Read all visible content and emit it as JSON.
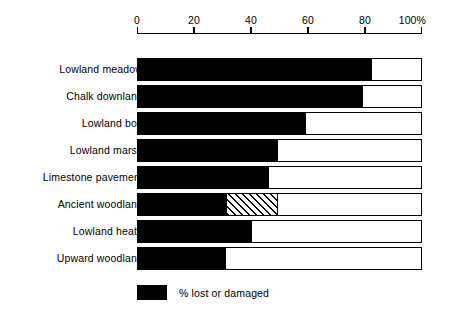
{
  "chart_data": {
    "type": "bar",
    "orientation": "horizontal",
    "title": "",
    "subtitle": "",
    "xlabel": "",
    "ylabel": "",
    "xlim": [
      0,
      100
    ],
    "grid": false,
    "axis_unit_suffix": "%",
    "tick_values": [
      0,
      20,
      40,
      60,
      80,
      100
    ],
    "tick_labels": [
      "0",
      "20",
      "40",
      "60",
      "80",
      "100%"
    ],
    "categories": [
      "Lowland meadow",
      "Chalk downland",
      "Lowland bog",
      "Lowland marsh",
      "Limestone pavement",
      "Ancient woodland",
      "Lowland heath",
      "Upward woodland"
    ],
    "values": [
      82,
      79,
      59,
      49,
      46,
      49,
      40,
      31
    ],
    "bars": [
      {
        "category": "Lowland meadow",
        "solid": 82,
        "hatch_start": null,
        "hatch_end": null,
        "total": 82
      },
      {
        "category": "Chalk downland",
        "solid": 79,
        "hatch_start": null,
        "hatch_end": null,
        "total": 79
      },
      {
        "category": "Lowland bog",
        "solid": 59,
        "hatch_start": null,
        "hatch_end": null,
        "total": 59
      },
      {
        "category": "Lowland marsh",
        "solid": 49,
        "hatch_start": null,
        "hatch_end": null,
        "total": 49
      },
      {
        "category": "Limestone pavement",
        "solid": 46,
        "hatch_start": null,
        "hatch_end": null,
        "total": 46
      },
      {
        "category": "Ancient woodland",
        "solid": 31,
        "hatch_start": 31,
        "hatch_end": 49,
        "total": 49
      },
      {
        "category": "Lowland heath",
        "solid": 40,
        "hatch_start": null,
        "hatch_end": null,
        "total": 40
      },
      {
        "category": "Upward woodland",
        "solid": 31,
        "hatch_start": null,
        "hatch_end": null,
        "total": 31
      }
    ],
    "legend": {
      "position": "bottom-left",
      "entries": [
        {
          "label": "% lost or damaged",
          "swatch": "solid-black",
          "color": "#000000"
        }
      ]
    },
    "colors": {
      "bar_fill": "#000000",
      "bar_background": "#ffffff",
      "bar_outline": "#000000",
      "axis": "#000000",
      "text": "#000000",
      "page_background": "#ffffff"
    }
  }
}
